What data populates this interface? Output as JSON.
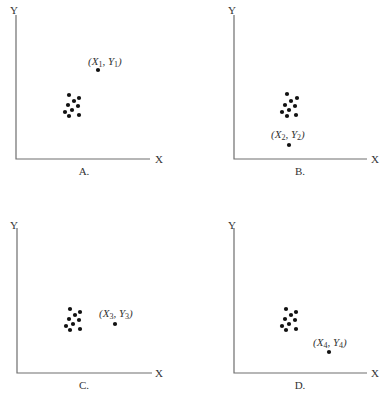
{
  "figure": {
    "width": 388,
    "height": 401,
    "colors": {
      "axis": "#6e6e6e",
      "dot": "#111111",
      "text": "#333333",
      "background": "#ffffff"
    }
  },
  "chart_data": [
    {
      "type": "scatter",
      "panel": "A.",
      "xlabel": "X",
      "ylabel": "Y",
      "cluster": [
        [
          69,
          95
        ],
        [
          79,
          98
        ],
        [
          74,
          101
        ],
        [
          68,
          105
        ],
        [
          78,
          106
        ],
        [
          72,
          110
        ],
        [
          65,
          112
        ],
        [
          69,
          116
        ],
        [
          79,
          115
        ]
      ],
      "outlier": {
        "label_var": "X",
        "label_var2": "Y",
        "sub": "1",
        "x": 98,
        "y": 70,
        "label_x": 88,
        "label_y": 65,
        "position": "above-right of cluster"
      },
      "axes": {
        "origin": [
          16,
          159
        ],
        "x_end": 150,
        "y_top": 15
      },
      "axis_label_pos": {
        "y": [
          10,
          14
        ],
        "x": [
          155,
          163
        ]
      },
      "panel_label_pos": [
        84,
        175
      ]
    },
    {
      "type": "scatter",
      "panel": "B.",
      "xlabel": "X",
      "ylabel": "Y",
      "cluster": [
        [
          287,
          94
        ],
        [
          297,
          98
        ],
        [
          291,
          101
        ],
        [
          285,
          105
        ],
        [
          295,
          106
        ],
        [
          289,
          110
        ],
        [
          282,
          112
        ],
        [
          287,
          116
        ],
        [
          296,
          115
        ]
      ],
      "outlier": {
        "label_var": "X",
        "label_var2": "Y",
        "sub": "2",
        "x": 289,
        "y": 145,
        "label_x": 271,
        "label_y": 138,
        "position": "below cluster"
      },
      "axes": {
        "origin": [
          234,
          159
        ],
        "x_end": 367,
        "y_top": 15
      },
      "axis_label_pos": {
        "y": [
          228,
          14
        ],
        "x": [
          371,
          163
        ]
      },
      "panel_label_pos": [
        300,
        175
      ]
    },
    {
      "type": "scatter",
      "panel": "C.",
      "xlabel": "X",
      "ylabel": "Y",
      "cluster": [
        [
          70,
          309
        ],
        [
          80,
          312
        ],
        [
          75,
          315
        ],
        [
          69,
          319
        ],
        [
          79,
          320
        ],
        [
          73,
          324
        ],
        [
          66,
          326
        ],
        [
          70,
          330
        ],
        [
          80,
          329
        ]
      ],
      "outlier": {
        "label_var": "X",
        "label_var2": "Y",
        "sub": "3",
        "x": 115,
        "y": 324,
        "label_x": 99,
        "label_y": 317,
        "position": "right of cluster"
      },
      "axes": {
        "origin": [
          17,
          373
        ],
        "x_end": 152,
        "y_top": 228
      },
      "axis_label_pos": {
        "y": [
          10,
          229
        ],
        "x": [
          155,
          377
        ]
      },
      "panel_label_pos": [
        84,
        389
      ]
    },
    {
      "type": "scatter",
      "panel": "D.",
      "xlabel": "X",
      "ylabel": "Y",
      "cluster": [
        [
          286,
          309
        ],
        [
          296,
          312
        ],
        [
          291,
          315
        ],
        [
          285,
          319
        ],
        [
          295,
          320
        ],
        [
          289,
          324
        ],
        [
          282,
          326
        ],
        [
          286,
          330
        ],
        [
          296,
          329
        ]
      ],
      "outlier": {
        "label_var": "X",
        "label_var2": "Y",
        "sub": "4",
        "x": 329,
        "y": 352,
        "label_x": 313,
        "label_y": 346,
        "position": "below-right of cluster"
      },
      "axes": {
        "origin": [
          234,
          373
        ],
        "x_end": 367,
        "y_top": 228
      },
      "axis_label_pos": {
        "y": [
          228,
          229
        ],
        "x": [
          371,
          377
        ]
      },
      "panel_label_pos": [
        300,
        389
      ]
    }
  ]
}
